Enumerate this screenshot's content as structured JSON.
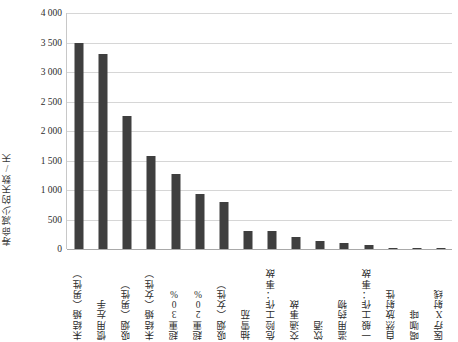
{
  "chart_data": {
    "type": "bar",
    "title": "",
    "subtitle": "",
    "xlabel": "",
    "ylabel": "寿命减少的天数/天",
    "ylim": [
      0,
      4000
    ],
    "ytick_values": [
      0,
      500,
      1000,
      1500,
      2000,
      2500,
      3000,
      3500,
      4000
    ],
    "ytick_labels": [
      "0",
      "500",
      "1 000",
      "1 500",
      "2 000",
      "2 500",
      "3 000",
      "3 500",
      "4 000"
    ],
    "grid": true,
    "legend": "none",
    "bar_color": "#3f3f3f",
    "categories": [
      "未结婚（男性）",
      "惯用左手",
      "吸烟（男性）",
      "未结婚（女性）",
      "超重30%",
      "超重20%",
      "吸烟（女性）",
      "抽雪茄",
      "危险工作：事故",
      "交通事故",
      "饮酒",
      "滥用药物",
      "一般工作：事故",
      "自然放射性",
      "喝咖啡",
      "医疗X射线"
    ],
    "values": [
      3500,
      3300,
      2250,
      1570,
      1270,
      930,
      800,
      300,
      300,
      200,
      130,
      100,
      75,
      8,
      6,
      4
    ],
    "series": [
      {
        "name": "寿命减少的天数",
        "values": [
          3500,
          3300,
          2250,
          1570,
          1270,
          930,
          800,
          300,
          300,
          200,
          130,
          100,
          75,
          8,
          6,
          4
        ]
      }
    ]
  }
}
